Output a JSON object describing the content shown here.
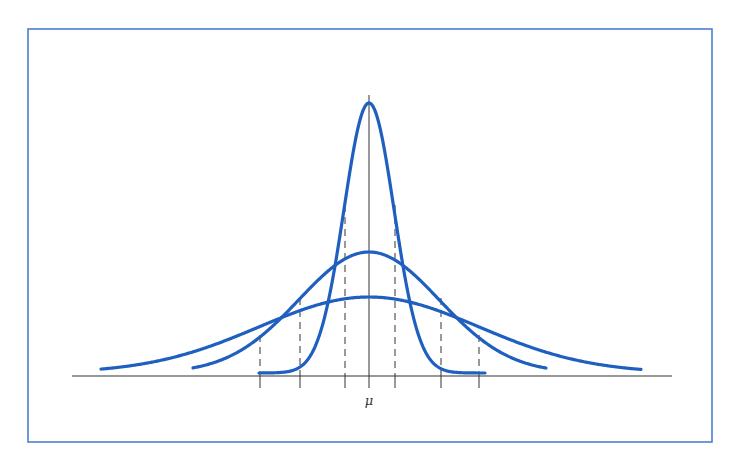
{
  "chart_data": {
    "type": "line",
    "title": "",
    "xlabel": "",
    "ylabel": "",
    "x_tick_labels": [
      "μ"
    ],
    "grid": false,
    "legend": null,
    "mean_label": "μ",
    "series": [
      {
        "name": "narrow",
        "sigma_relative": 1.0,
        "peak_relative": 1.0,
        "sigma_px": 25,
        "peak_height_px": 273,
        "x_range_px": [
          259,
          485
        ]
      },
      {
        "name": "medium",
        "sigma_relative": 2.8,
        "peak_relative": 0.45,
        "sigma_px": 70,
        "peak_height_px": 124,
        "x_range_px": [
          193,
          546
        ]
      },
      {
        "name": "wide",
        "sigma_relative": 4.4,
        "peak_relative": 0.29,
        "sigma_px": 110,
        "peak_height_px": 79,
        "x_range_px": [
          101,
          641
        ]
      }
    ],
    "sigma_markers_px": [
      {
        "x": 260,
        "top": 335,
        "curve": "wide"
      },
      {
        "x": 300,
        "top": 298,
        "curve": "medium"
      },
      {
        "x": 345,
        "top": 205,
        "curve": "narrow"
      },
      {
        "x": 395,
        "top": 205,
        "curve": "narrow"
      },
      {
        "x": 441,
        "top": 298,
        "curve": "medium"
      },
      {
        "x": 479,
        "top": 335,
        "curve": "wide"
      }
    ]
  },
  "layout": {
    "frame": {
      "x": 28,
      "y": 29,
      "w": 684,
      "h": 413,
      "color": "#4a7fd0"
    },
    "baseline": {
      "y": 376,
      "x1": 72,
      "x2": 672
    },
    "mean_axis": {
      "x": 369,
      "y_top": 95
    },
    "tick_bottom": 388,
    "mu_label_pos": {
      "x": 369,
      "y": 405
    }
  },
  "colors": {
    "curve": "#1f5fbf",
    "axis": "#333333",
    "frame": "#4a7fd0",
    "background": "#ffffff"
  }
}
